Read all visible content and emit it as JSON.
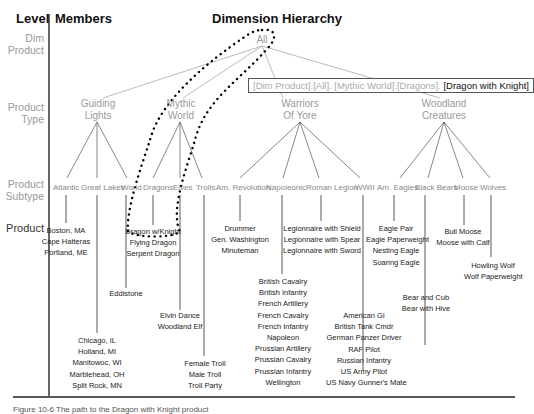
{
  "headers": {
    "level": "Level",
    "members": "Members",
    "hierarchy": "Dimension Hierarchy"
  },
  "levels": [
    {
      "name": "Dim Product",
      "l1": "Dim",
      "l2": "Product"
    },
    {
      "name": "Product Type",
      "l1": "Product",
      "l2": "Type"
    },
    {
      "name": "Product Subtype",
      "l1": "Product",
      "l2": "Subtype"
    },
    {
      "name": "Product",
      "l1": "Product",
      "l2": ""
    }
  ],
  "root": "All",
  "member_path": {
    "prefix": "[Dim Product].[All]. [Mythic World].[Dragons]. ",
    "highlight": "[Dragon with Knight]"
  },
  "product_types": [
    {
      "l1": "Guiding",
      "l2": "Lights"
    },
    {
      "l1": "Mythic",
      "l2": "World"
    },
    {
      "l1": "Warriors",
      "l2": "Of Yore"
    },
    {
      "l1": "Woodland",
      "l2": "Creatures"
    }
  ],
  "subtypes": [
    {
      "name": "Atlantic",
      "products": [
        "Boston, MA",
        "Cape Hatteras",
        "Portland, ME"
      ]
    },
    {
      "name": "Great Lakes",
      "products": [
        "Chicago, IL",
        "Holland, MI",
        "Manitowoc, WI",
        "Marblehead, OH",
        "Split Rock, MN"
      ]
    },
    {
      "name": "World",
      "products": [
        "Eddistone"
      ]
    },
    {
      "name": "Dragons",
      "products": [
        "Dragon w/Knight",
        "Flying Dragon",
        "Serpent Dragon"
      ]
    },
    {
      "name": "Elves",
      "products": [
        "Elvin Dance",
        "Woodland Elf"
      ]
    },
    {
      "name": "Trolls",
      "products": [
        "Female Troll",
        "Male Troll",
        "Troll Party"
      ]
    },
    {
      "name": "Am. Revolution",
      "products": [
        "Drummer",
        "Gen. Washington",
        "Minuteman"
      ]
    },
    {
      "name": "Napoleonic",
      "products": [
        "British Cavalry",
        "British Infantry",
        "French Artillery",
        "French Cavalry",
        "French Infantry",
        "Napoleon",
        "Prussian Artillery",
        "Prussian Cavalry",
        "Prussian Infantry",
        "Wellington"
      ]
    },
    {
      "name": "Roman Legion",
      "products": [
        "Legionnaire with Shield",
        "Legionnaire with Spear",
        "Legionnaire with Sword"
      ]
    },
    {
      "name": "WWII",
      "products": [
        "American GI",
        "British Tank Cmdr",
        "German Panzer Driver",
        "RAF Pilot",
        "Russian Infantry",
        "US Army Pilot",
        "US Navy Gunner's Mate"
      ]
    },
    {
      "name": "Am. Eagles",
      "products": [
        "Eagle Pair",
        "Eagle Paperweight",
        "Nesting Eagle",
        "Soaring Eagle"
      ]
    },
    {
      "name": "Black Bears",
      "products": [
        "Bear and Cub",
        "Bear with Hive"
      ]
    },
    {
      "name": "Moose",
      "products": [
        "Bull Moose",
        "Moose with Calf"
      ]
    },
    {
      "name": "Wolves",
      "products": [
        "Howling Wolf",
        "Wolf Paperweight"
      ]
    }
  ],
  "caption": "Figure 10-6   The path to the Dragon with Knight product"
}
